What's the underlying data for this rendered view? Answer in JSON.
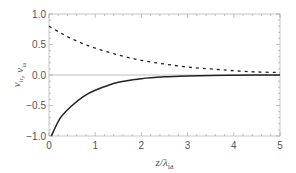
{
  "chart_data": {
    "type": "line",
    "title": "",
    "xlabel": "z/λ_ia",
    "ylabel": "v_ir, v_ia",
    "xlabel_main": "z/λ",
    "xlabel_sub": "ia",
    "ylabel_parts": [
      {
        "main": "v",
        "sub": "ir"
      },
      {
        "main": ", v",
        "sub": "ia"
      }
    ],
    "xlim": [
      0,
      5
    ],
    "ylim": [
      -1.0,
      1.0
    ],
    "x_ticks": [
      "0",
      "1",
      "2",
      "3",
      "4",
      "5"
    ],
    "y_ticks": [
      "1.0",
      "0.5",
      "0.0",
      "-0.5",
      "-1.0"
    ],
    "grid": false,
    "legend": "none",
    "series": [
      {
        "name": "dashed",
        "style": "dashed",
        "x": [
          0,
          0.25,
          0.5,
          0.75,
          1,
          1.5,
          2,
          2.5,
          3,
          3.5,
          4,
          4.5,
          5
        ],
        "values": [
          0.8,
          0.69,
          0.59,
          0.51,
          0.44,
          0.33,
          0.24,
          0.18,
          0.13,
          0.1,
          0.07,
          0.05,
          0.04
        ]
      },
      {
        "name": "solid",
        "style": "solid",
        "x": [
          0.05,
          0.25,
          0.5,
          0.75,
          1,
          1.5,
          2,
          2.5,
          3,
          3.5,
          4,
          4.5,
          5
        ],
        "values": [
          -1.0,
          -0.7,
          -0.5,
          -0.35,
          -0.25,
          -0.12,
          -0.06,
          -0.03,
          -0.015,
          -0.007,
          -0.004,
          -0.002,
          -0.001
        ]
      }
    ]
  }
}
